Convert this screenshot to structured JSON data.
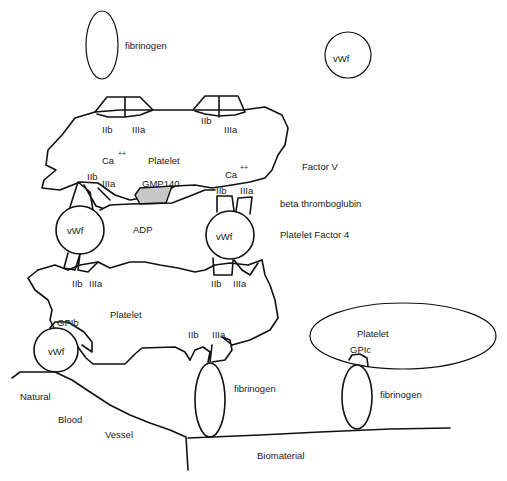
{
  "diagram": {
    "free_molecules": {
      "fibrinogen_top": "fibrinogen",
      "vwf_top": "vWf"
    },
    "platelet_top": {
      "label": "Platelet",
      "calcium": "Ca",
      "calcium_charge": "++",
      "calcium2": "Ca",
      "calcium2_charge": "++",
      "receptors": [
        {
          "iib": "IIb",
          "iiia": "IIIa"
        },
        {
          "iib": "IIb",
          "iiia": "IIIa"
        },
        {
          "iib": "IIb",
          "iiia": "IIIa"
        },
        {
          "iib": "IIb",
          "iiia": "IIIa"
        }
      ],
      "gmp": "GMP140"
    },
    "released_factors": [
      "Factor V",
      "beta thromboglubin",
      "Platelet Factor 4"
    ],
    "bridges": {
      "vwf_left": "vWf",
      "vwf_right": "vWf",
      "adp": "ADP"
    },
    "platelet_bottom": {
      "label": "Platelet",
      "gpib": "GPIb",
      "receptors": [
        {
          "iib": "IIb",
          "iiia": "IIIa"
        },
        {
          "iib": "IIb",
          "iiia": "IIIa"
        },
        {
          "iib": "IIb",
          "iiia": "IIIa"
        }
      ],
      "vwf": "vWf",
      "fibrinogen": "fibrinogen"
    },
    "platelet_biomaterial": {
      "label": "Platelet",
      "gpic": "GPIc",
      "fibrinogen": "fibrinogen"
    },
    "surfaces": {
      "natural": "Natural",
      "blood": "Blood",
      "vessel": "Vessel",
      "biomaterial": "Biomaterial"
    },
    "colors": {
      "line": "#111111",
      "gmp_fill": "#c8c8c8",
      "background": "#ffffff"
    }
  }
}
